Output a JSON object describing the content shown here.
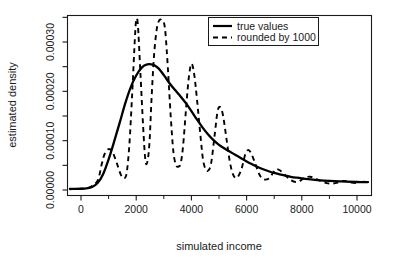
{
  "chart_data": {
    "type": "line",
    "title": "",
    "xlabel": "simulated income",
    "ylabel": "estimated density",
    "xlim": [
      -400,
      10400
    ],
    "ylim": [
      0,
      0.000347
    ],
    "xticks": [
      0,
      2000,
      4000,
      6000,
      8000,
      10000
    ],
    "xtick_labels": [
      "0",
      "2000",
      "4000",
      "6000",
      "8000",
      "10000"
    ],
    "yticks": [
      0.0,
      0.0001,
      0.0002,
      0.0003
    ],
    "ytick_labels": [
      "0.00000",
      "0.00010",
      "0.00020",
      "0.00030"
    ],
    "minor_yticks": [
      5e-05,
      0.00015,
      0.00025,
      0.00035
    ],
    "grid": false,
    "legend_position": "top-right",
    "legend": [
      {
        "label": "true values",
        "style": "solid"
      },
      {
        "label": "rounded by 1000",
        "style": "dashed"
      }
    ],
    "series": [
      {
        "name": "true values",
        "style": "solid",
        "x": [
          -400,
          0,
          200,
          400,
          600,
          800,
          1000,
          1200,
          1400,
          1600,
          1800,
          2000,
          2200,
          2400,
          2600,
          2800,
          3000,
          3200,
          3400,
          3600,
          3800,
          4000,
          4200,
          4400,
          4600,
          4800,
          5000,
          5200,
          5400,
          5600,
          5800,
          6000,
          6200,
          6400,
          6600,
          6800,
          7000,
          7200,
          7400,
          7600,
          7800,
          8000,
          8400,
          8800,
          9200,
          9600,
          10000,
          10400
        ],
        "y": [
          2e-06,
          2.5e-06,
          3.5e-06,
          6e-06,
          1.4e-05,
          3.2e-05,
          6.2e-05,
          9.8e-05,
          0.000136,
          0.000175,
          0.000208,
          0.000232,
          0.000248,
          0.0002545,
          0.000254,
          0.000247,
          0.000233,
          0.000217,
          0.000203,
          0.00019,
          0.000176,
          0.00016,
          0.000143,
          0.000127,
          0.000113,
          0.000101,
          9.15e-05,
          8.4e-05,
          7.75e-05,
          7.1e-05,
          6.45e-05,
          5.8e-05,
          5.2e-05,
          4.65e-05,
          4.2e-05,
          3.8e-05,
          3.45e-05,
          3.15e-05,
          2.9e-05,
          2.68e-05,
          2.5e-05,
          2.35e-05,
          2.1e-05,
          1.92e-05,
          1.78e-05,
          1.68e-05,
          1.62e-05,
          1.6e-05
        ]
      },
      {
        "name": "rounded by 1000",
        "style": "dashed",
        "x": [
          -400,
          0,
          300,
          600,
          750,
          850,
          1000,
          1150,
          1300,
          1450,
          1550,
          1650,
          1750,
          1850,
          1950,
          2000,
          2060,
          2150,
          2250,
          2330,
          2400,
          2480,
          2560,
          2650,
          2750,
          2850,
          2950,
          3000,
          3060,
          3150,
          3250,
          3350,
          3450,
          3550,
          3620,
          3700,
          3800,
          3900,
          4000,
          4100,
          4200,
          4320,
          4420,
          4520,
          4620,
          4720,
          4850,
          4950,
          5050,
          5150,
          5280,
          5400,
          5520,
          5650,
          5800,
          5950,
          6050,
          6150,
          6300,
          6450,
          6600,
          6800,
          6950,
          7050,
          7200,
          7400,
          7600,
          7800,
          7950,
          8100,
          8300,
          8500,
          8700,
          8900,
          9100,
          9300,
          9450,
          9600,
          9800,
          9950,
          10100,
          10400
        ],
        "y": [
          2e-06,
          2.5e-06,
          5e-06,
          1.9e-05,
          5.2e-05,
          7.2e-05,
          8.3e-05,
          7.6e-05,
          5.4e-05,
          3e-05,
          2.4e-05,
          3.3e-05,
          9e-05,
          0.00019,
          0.000305,
          0.000344,
          0.000335,
          0.00024,
          0.00013,
          6.2e-05,
          5.6e-05,
          9.5e-05,
          0.00019,
          0.000275,
          0.000328,
          0.000345,
          0.000343,
          0.00034,
          0.000318,
          0.000245,
          0.00015,
          7.6e-05,
          5e-05,
          4.8e-05,
          5.6e-05,
          9e-05,
          0.00016,
          0.000225,
          0.000256,
          0.000235,
          0.000185,
          0.000115,
          6.2e-05,
          4.2e-05,
          4e-05,
          5.6e-05,
          0.000115,
          0.00016,
          0.000168,
          0.00015,
          0.0001,
          5.5e-05,
          3e-05,
          2.5e-05,
          4e-05,
          7.2e-05,
          8.1e-05,
          7.6e-05,
          5.6e-05,
          3.3e-05,
          2.2e-05,
          2.3e-05,
          3.4e-05,
          4.2e-05,
          4e-05,
          3e-05,
          2e-05,
          1.6e-05,
          1.9e-05,
          2.5e-05,
          2.7e-05,
          2.3e-05,
          1.8e-05,
          1.4e-05,
          1.3e-05,
          1.5e-05,
          1.8e-05,
          1.8e-05,
          1.5e-05,
          1.4e-05,
          1.6e-05,
          1.75e-05
        ]
      }
    ],
    "colors": {
      "axis": "#1a1a1a",
      "true_values_line": "#000000",
      "rounded_line": "#000000",
      "background": "#ffffff"
    }
  }
}
